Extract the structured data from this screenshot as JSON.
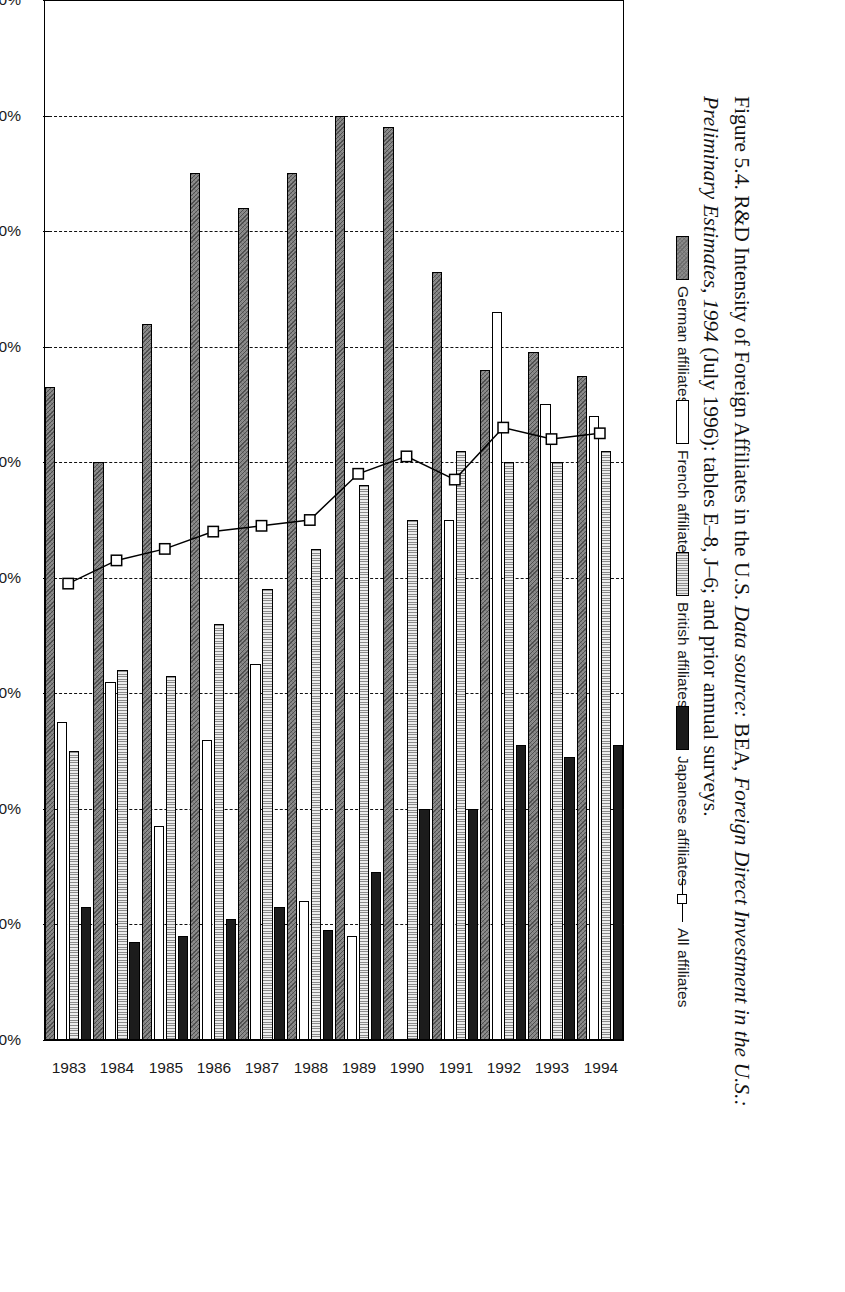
{
  "figure": {
    "caption_prefix": "Figure 5.4. R&D Intensity of Foreign Affiliates in the U.S. ",
    "caption_source_italic_1": "Data source:",
    "caption_source_rest_1": " BEA, ",
    "caption_source_italic_2": "Foreign Direct Investment in the U.S.: Preliminary Estimates, 1994",
    "caption_source_rest_2": " (July 1996): tables E–8, J–6; and prior annual surveys."
  },
  "legend": {
    "position": "top",
    "entries": [
      {
        "label": "German affiliates",
        "swatch": "german-swatch",
        "color": "#8c8c8c",
        "style": "stipple"
      },
      {
        "label": "French affiliates",
        "swatch": "french-swatch",
        "color": "#ffffff",
        "style": "solid-white"
      },
      {
        "label": "British affiliates",
        "swatch": "british-swatch",
        "color": "#dcdcdc",
        "style": "vertical-hatch"
      },
      {
        "label": "Japanese affiliates",
        "swatch": "japanese-swatch",
        "color": "#1c1c1c",
        "style": "solid-black"
      },
      {
        "label": "All affiliates",
        "swatch": "line-marker",
        "color": "#000000",
        "style": "line-square-marker"
      }
    ]
  },
  "chart_data": {
    "type": "bar",
    "orientation": "horizontal-rotated",
    "title": "R&D Intensity of Foreign Affiliates in the U.S.",
    "xlabel": "",
    "ylabel": "R&D/sales",
    "ylim": [
      0.0,
      1.8
    ],
    "ytick_labels": [
      "1.80%",
      "1.60%",
      "1.40%",
      "1.20%",
      "1.00%",
      "0.80%",
      "0.60%",
      "0.40%",
      "0.20%",
      "0.00%"
    ],
    "ytick_values": [
      1.8,
      1.6,
      1.4,
      1.2,
      1.0,
      0.8,
      0.6,
      0.4,
      0.2,
      0.0
    ],
    "grid": true,
    "categories": [
      "1983",
      "1984",
      "1985",
      "1986",
      "1987",
      "1988",
      "1989",
      "1990",
      "1991",
      "1992",
      "1993",
      "1994"
    ],
    "series": [
      {
        "name": "German affiliates",
        "values": [
          1.13,
          1.0,
          1.24,
          1.5,
          1.44,
          1.5,
          1.6,
          1.58,
          1.33,
          1.16,
          1.19,
          1.15
        ]
      },
      {
        "name": "French affiliates",
        "values": [
          0.55,
          0.62,
          0.37,
          0.52,
          0.65,
          0.24,
          0.18,
          0.0,
          0.9,
          1.26,
          1.1,
          1.08
        ]
      },
      {
        "name": "British affiliates",
        "values": [
          0.5,
          0.64,
          0.63,
          0.72,
          0.78,
          0.85,
          0.96,
          0.9,
          1.02,
          1.0,
          1.0,
          1.02
        ]
      },
      {
        "name": "Japanese affiliates",
        "values": [
          0.23,
          0.17,
          0.18,
          0.21,
          0.23,
          0.19,
          0.29,
          0.4,
          0.4,
          0.51,
          0.49,
          0.51
        ]
      },
      {
        "name": "All affiliates",
        "values": [
          0.79,
          0.83,
          0.85,
          0.88,
          0.89,
          0.9,
          0.98,
          1.01,
          0.97,
          1.06,
          1.04,
          1.05
        ],
        "render": "line"
      }
    ]
  }
}
